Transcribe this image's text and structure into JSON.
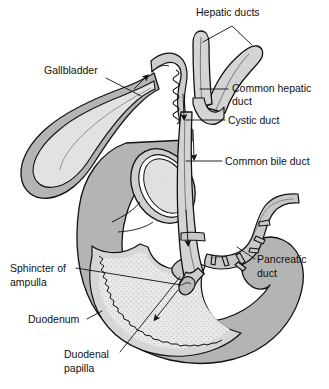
{
  "figure": {
    "top_faint_note": "",
    "background_color": "#ffffff",
    "ink_color": "#111111"
  },
  "palette": {
    "wall_gray": "#b4b4b4",
    "wall_gray_dark": "#a2a2a2",
    "lumen_light": "#e6e6e6",
    "lumen_stipple": "#dcdcdc",
    "duct_fill": "#d9d9d9",
    "duct_inner": "#ededed",
    "outline": "#111111",
    "white": "#ffffff"
  },
  "labels": [
    {
      "id": "hepatic-ducts",
      "text": "Hepatic ducts",
      "x": 196,
      "y": 16,
      "anchor": "start"
    },
    {
      "id": "gallbladder",
      "text": "Gallbladder",
      "x": 44,
      "y": 74,
      "anchor": "start"
    },
    {
      "id": "common-hepatic-duct-line1",
      "text": "Common hepatic",
      "x": 232,
      "y": 92,
      "anchor": "start"
    },
    {
      "id": "common-hepatic-duct-line2",
      "text": "duct",
      "x": 232,
      "y": 105,
      "anchor": "start"
    },
    {
      "id": "cystic-duct",
      "text": "Cystic duct",
      "x": 228,
      "y": 124,
      "anchor": "start"
    },
    {
      "id": "common-bile-duct",
      "text": "Common bile duct",
      "x": 225,
      "y": 165,
      "anchor": "start"
    },
    {
      "id": "pancreatic-duct-line1",
      "text": "Pancreatic",
      "x": 257,
      "y": 263,
      "anchor": "start"
    },
    {
      "id": "pancreatic-duct-line2",
      "text": "duct",
      "x": 257,
      "y": 277,
      "anchor": "start"
    },
    {
      "id": "sphincter-of-ampulla-line1",
      "text": "Sphincter of",
      "x": 10,
      "y": 272,
      "anchor": "start"
    },
    {
      "id": "sphincter-of-ampulla-line2",
      "text": "ampulla",
      "x": 10,
      "y": 286,
      "anchor": "start"
    },
    {
      "id": "duodenum",
      "text": "Duodenum",
      "x": 28,
      "y": 323,
      "anchor": "start"
    },
    {
      "id": "duodenal-papilla-line1",
      "text": "Duodenal",
      "x": 64,
      "y": 358,
      "anchor": "start"
    },
    {
      "id": "duodenal-papilla-line2",
      "text": "papilla",
      "x": 64,
      "y": 372,
      "anchor": "start"
    }
  ],
  "structures": [
    {
      "id": "gallbladder",
      "name": "Gallbladder"
    },
    {
      "id": "hepatic-duct-left",
      "name": "Left hepatic duct"
    },
    {
      "id": "hepatic-duct-right",
      "name": "Right hepatic duct"
    },
    {
      "id": "common-hepatic-duct",
      "name": "Common hepatic duct"
    },
    {
      "id": "cystic-duct",
      "name": "Cystic duct"
    },
    {
      "id": "common-bile-duct",
      "name": "Common bile duct"
    },
    {
      "id": "pancreatic-duct",
      "name": "Pancreatic duct"
    },
    {
      "id": "sphincter-of-ampulla",
      "name": "Sphincter of ampulla"
    },
    {
      "id": "duodenum",
      "name": "Duodenum"
    },
    {
      "id": "duodenal-papilla",
      "name": "Duodenal papilla"
    }
  ],
  "flow_arrows": [
    {
      "id": "arrow-into-gallbladder",
      "direction": "up-right",
      "meaning": "bile into gallbladder"
    },
    {
      "id": "arrow-down-cystic",
      "direction": "down",
      "meaning": "bile down cystic duct"
    },
    {
      "id": "arrow-down-cbd-upper",
      "direction": "down",
      "meaning": "bile down common bile duct"
    },
    {
      "id": "arrow-down-cbd-lower",
      "direction": "down",
      "meaning": "bile toward ampulla"
    },
    {
      "id": "arrow-into-duodenum",
      "direction": "down",
      "meaning": "bile into duodenal lumen"
    }
  ]
}
